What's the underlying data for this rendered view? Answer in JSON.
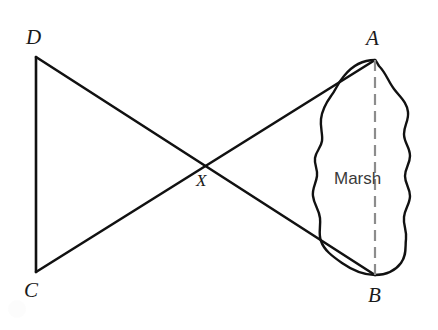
{
  "figure": {
    "type": "geometry-diagram",
    "background_color": "#ffffff",
    "line_color": "#111111",
    "dashed_line_color": "#8c8c8c",
    "label_color": "#1a1a1a",
    "marsh_text_color": "#3a3a3a"
  },
  "labels": {
    "a": "A",
    "b": "B",
    "c": "C",
    "d": "D",
    "x": "X",
    "marsh": "Marsh"
  },
  "points": {
    "A": {
      "x": 375,
      "y": 60
    },
    "B": {
      "x": 375,
      "y": 275
    },
    "C": {
      "x": 36,
      "y": 272
    },
    "D": {
      "x": 36,
      "y": 57
    },
    "X": {
      "x": 205,
      "y": 164
    }
  },
  "segments": [
    {
      "name": "DC",
      "from": "D",
      "to": "C",
      "style": "solid"
    },
    {
      "name": "DB",
      "from": "D",
      "to": "B",
      "style": "solid"
    },
    {
      "name": "CA",
      "from": "C",
      "to": "A",
      "style": "solid"
    },
    {
      "name": "AB",
      "from": "A",
      "to": "B",
      "style": "dashed"
    }
  ],
  "label_positions": {
    "A": {
      "x": 366,
      "y": 28
    },
    "B": {
      "x": 368,
      "y": 285
    },
    "C": {
      "x": 24,
      "y": 280
    },
    "D": {
      "x": 26,
      "y": 27
    },
    "X": {
      "x": 196,
      "y": 172
    },
    "marsh": {
      "x": 334,
      "y": 170
    }
  },
  "marsh_outline": "M 375 60 C 362 60 352 66 344 76 C 337 84 336 90 331 96 C 326 103 322 110 321 119 C 320 128 323 134 322 141 C 321 148 316 151 315 158 C 314 165 318 169 317 176 C 316 184 312 188 313 196 C 314 205 319 209 320 218 C 321 227 318 233 321 241 C 324 250 332 256 342 263 C 352 270 365 275 375 275 C 385 275 395 271 401 263 C 407 255 405 247 406 239 C 407 230 403 225 404 217 C 405 208 410 204 410 196 C 410 188 405 184 405 176 C 405 168 410 164 410 156 C 410 147 404 143 404 134 C 404 125 409 121 408 112 C 407 102 400 97 394 89 C 388 81 386 73 379 66 C 377 63 376 60 375 60 Z"
}
